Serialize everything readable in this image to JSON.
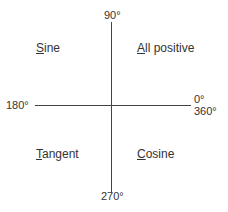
{
  "diagram": {
    "axes": {
      "top": "90°",
      "left": "180°",
      "right_top": "0°",
      "right_bottom": "360°",
      "bottom": "270°"
    },
    "quadrants": {
      "top_left": {
        "first": "S",
        "rest": "ine"
      },
      "top_right": {
        "first": "A",
        "rest": "ll positive"
      },
      "bottom_left": {
        "first": "T",
        "rest": "angent"
      },
      "bottom_right": {
        "first": "C",
        "rest": "osine"
      }
    }
  }
}
